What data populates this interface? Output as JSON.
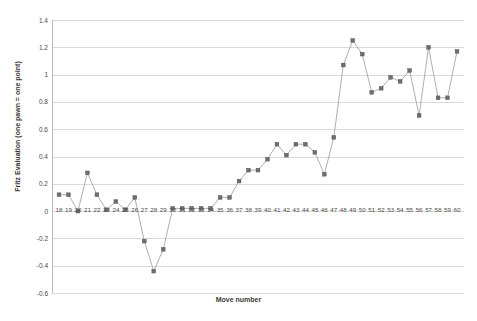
{
  "chart_data": {
    "type": "line",
    "title": "",
    "xlabel": "Move number",
    "ylabel": "Fritz Evaluation (one pawn = one point)",
    "x": [
      18,
      19,
      20,
      21,
      22,
      23,
      24,
      25,
      26,
      27,
      28,
      29,
      30,
      31,
      32,
      33,
      34,
      35,
      36,
      37,
      38,
      39,
      40,
      41,
      42,
      43,
      44,
      45,
      46,
      47,
      48,
      49,
      50,
      51,
      52,
      53,
      54,
      55,
      56,
      57,
      58,
      59,
      60
    ],
    "values": [
      0.12,
      0.12,
      0.0,
      0.28,
      0.12,
      0.01,
      0.07,
      0.01,
      0.1,
      -0.22,
      -0.44,
      -0.28,
      0.02,
      0.02,
      0.02,
      0.02,
      0.02,
      0.1,
      0.1,
      0.22,
      0.3,
      0.3,
      0.38,
      0.49,
      0.41,
      0.49,
      0.49,
      0.43,
      0.27,
      0.54,
      1.07,
      1.25,
      1.15,
      0.87,
      0.9,
      0.98,
      0.95,
      1.03,
      0.7,
      1.2,
      0.83,
      0.83,
      1.17
    ],
    "series": [
      {
        "name": "Fritz evaluation",
        "values": [
          0.12,
          0.12,
          0.0,
          0.28,
          0.12,
          0.01,
          0.07,
          0.01,
          0.1,
          -0.22,
          -0.44,
          -0.28,
          0.02,
          0.02,
          0.02,
          0.02,
          0.02,
          0.1,
          0.1,
          0.22,
          0.3,
          0.3,
          0.38,
          0.49,
          0.41,
          0.49,
          0.49,
          0.43,
          0.27,
          0.54,
          1.07,
          1.25,
          1.15,
          0.87,
          0.9,
          0.98,
          0.95,
          1.03,
          0.7,
          1.2,
          0.83,
          0.83,
          1.17
        ]
      }
    ],
    "ylim": [
      -0.6,
      1.4
    ],
    "xlim": [
      18,
      60
    ],
    "yticks": [
      1.4,
      1.2,
      1,
      0.8,
      0.6,
      0.4,
      0.2,
      0,
      -0.2,
      -0.4,
      -0.6
    ],
    "ytick_labels": [
      "1.4",
      "1.2",
      "1",
      "0.8",
      "0.6",
      "0.4",
      "0.2",
      "0",
      "-0.2",
      "-0.4",
      "-0.6"
    ],
    "xtick_labels": [
      "18",
      "19",
      "20",
      "21",
      "22",
      "23",
      "24",
      "25",
      "26",
      "27",
      "28",
      "29",
      "30",
      "31",
      "32",
      "33",
      "34",
      "35",
      "36",
      "37",
      "38",
      "39",
      "40",
      "41",
      "42",
      "43",
      "44",
      "45",
      "46",
      "47",
      "48",
      "49",
      "50",
      "51",
      "52",
      "53",
      "54",
      "55",
      "56",
      "57",
      "58",
      "59",
      "60"
    ],
    "grid": true,
    "legend": "none",
    "marker": "square",
    "line_color": "#9a9a9a",
    "marker_color": "#6e6e6e",
    "grid_color": "#d9d9d9",
    "background_color": "#ffffff"
  }
}
